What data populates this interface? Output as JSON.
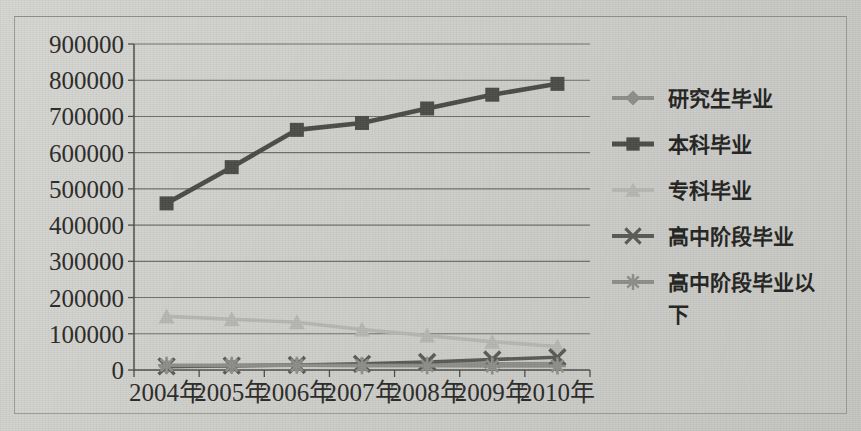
{
  "chart_data": {
    "type": "line",
    "title": "",
    "xlabel": "",
    "ylabel": "",
    "categories": [
      "2004年",
      "2005年",
      "2006年",
      "2007年",
      "2008年",
      "2009年",
      "2010年"
    ],
    "ylim": [
      0,
      900000
    ],
    "ytick_values": [
      0,
      100000,
      200000,
      300000,
      400000,
      500000,
      600000,
      700000,
      800000,
      900000
    ],
    "ytick_labels": [
      "0",
      "100000",
      "200000",
      "300000",
      "400000",
      "500000",
      "600000",
      "700000",
      "800000",
      "900000"
    ],
    "grid": true,
    "legend_position": "right",
    "series": [
      {
        "name": "研究生毕业",
        "marker": "diamond",
        "color": "#8d8d89",
        "values": [
          9000,
          11000,
          13000,
          15000,
          16000,
          17000,
          18000
        ]
      },
      {
        "name": "本科毕业",
        "marker": "square",
        "color": "#4b4b48",
        "values": [
          460000,
          560000,
          663000,
          682000,
          722000,
          760000,
          790000
        ]
      },
      {
        "name": "专科毕业",
        "marker": "triangle",
        "color": "#b6b6b2",
        "values": [
          148000,
          140000,
          132000,
          112000,
          95000,
          78000,
          65000
        ]
      },
      {
        "name": "高中阶段毕业",
        "marker": "x",
        "color": "#595956",
        "values": [
          10000,
          12000,
          14000,
          17000,
          22000,
          29000,
          35000
        ]
      },
      {
        "name": "高中阶段毕业以下",
        "marker": "asterisk",
        "color": "#8d8d89",
        "values": [
          13000,
          13000,
          13000,
          12000,
          12000,
          11000,
          11000
        ]
      }
    ]
  },
  "legend": {
    "items": [
      {
        "label": "研究生毕业"
      },
      {
        "label": "本科毕业"
      },
      {
        "label": "专科毕业"
      },
      {
        "label": "高中阶段毕业"
      },
      {
        "label": "高中阶段毕业以下"
      }
    ]
  }
}
